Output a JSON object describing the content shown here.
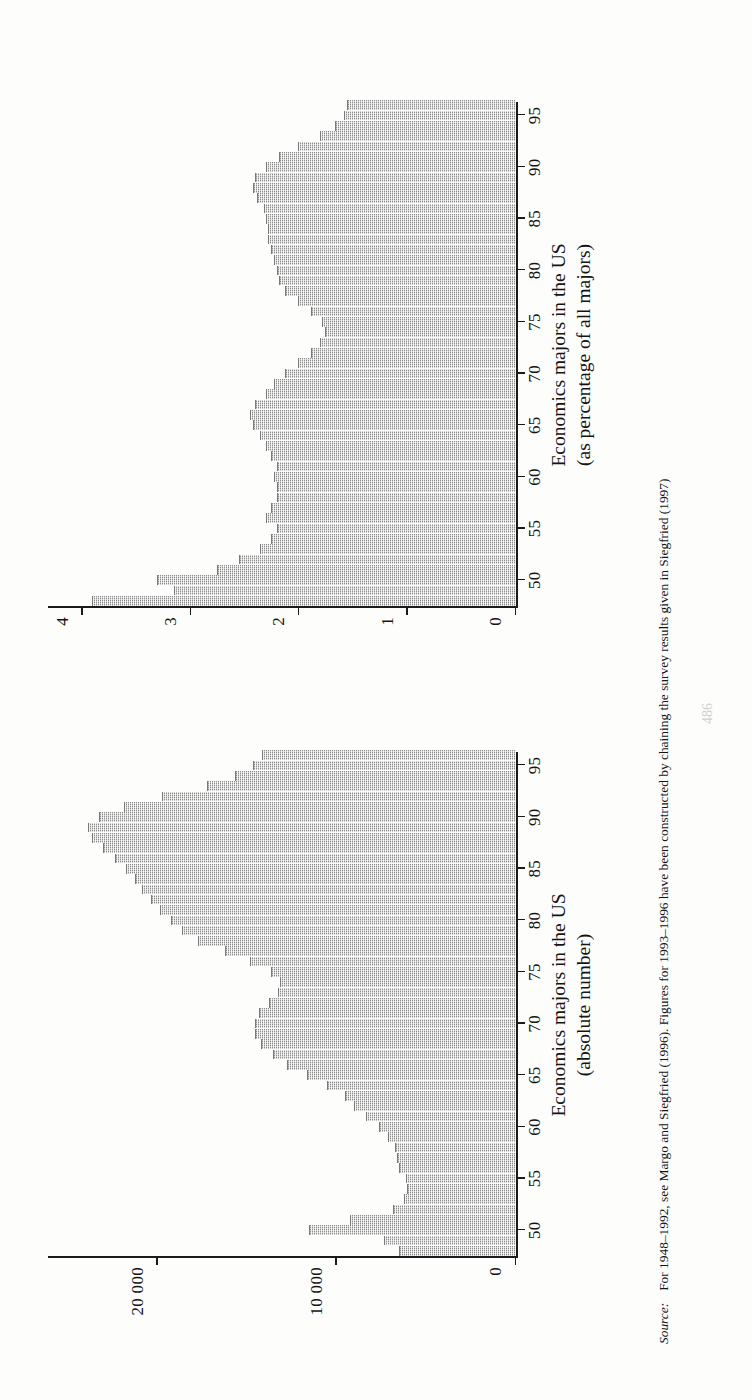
{
  "page": {
    "number": "486"
  },
  "source": {
    "label": "Source:",
    "text": "For 1948–1992, see Margo and Siegfried (1996). Figures for 1993–1996 have been constructed by chaining the survey results given in Siegfried (1997)"
  },
  "charts": [
    {
      "id": "economics-majors-absolute",
      "caption_line1": "Economics majors in the US",
      "caption_line2": "(absolute number)",
      "chart_data": {
        "type": "bar",
        "title": "Economics majors in the US (absolute number)",
        "xlabel": "",
        "ylabel": "",
        "grid": false,
        "legend": null,
        "xlim": [
          1947.5,
          1996.5
        ],
        "ylim": [
          0,
          26000
        ],
        "xticks": [
          50,
          55,
          60,
          65,
          70,
          75,
          80,
          85,
          90,
          95
        ],
        "xticklabels": [
          "50",
          "55",
          "60",
          "65",
          "70",
          "75",
          "80",
          "85",
          "90",
          "95"
        ],
        "yticks": [
          0,
          10000,
          20000
        ],
        "yticklabels": [
          "0",
          "10 000",
          "20 000"
        ],
        "categories": [
          1948,
          1949,
          1950,
          1951,
          1952,
          1953,
          1954,
          1955,
          1956,
          1957,
          1958,
          1959,
          1960,
          1961,
          1962,
          1963,
          1964,
          1965,
          1966,
          1967,
          1968,
          1969,
          1970,
          1971,
          1972,
          1973,
          1974,
          1975,
          1976,
          1977,
          1978,
          1979,
          1980,
          1981,
          1982,
          1983,
          1984,
          1985,
          1986,
          1987,
          1988,
          1989,
          1990,
          1991,
          1992,
          1993,
          1994,
          1995,
          1996
        ],
        "values": [
          6500,
          7300,
          11500,
          9200,
          6800,
          6200,
          6000,
          6100,
          6500,
          6600,
          6700,
          7100,
          7600,
          8300,
          9000,
          9500,
          10500,
          11600,
          12700,
          13500,
          14200,
          14500,
          14500,
          14300,
          13700,
          13200,
          13100,
          13600,
          14800,
          16200,
          17700,
          18600,
          19200,
          19800,
          20300,
          20800,
          21200,
          21700,
          22300,
          23000,
          23600,
          23800,
          23200,
          21800,
          19700,
          17200,
          15600,
          14600,
          14100
        ]
      }
    },
    {
      "id": "economics-majors-percentage",
      "caption_line1": "Economics majors in the US",
      "caption_line2": "(as percentage of all majors)",
      "chart_data": {
        "type": "bar",
        "title": "Economics majors in the US (as percentage of all majors)",
        "xlabel": "",
        "ylabel": "",
        "grid": false,
        "legend": null,
        "xlim": [
          1947.5,
          1996.5
        ],
        "ylim": [
          0,
          4.3
        ],
        "xticks": [
          50,
          55,
          60,
          65,
          70,
          75,
          80,
          85,
          90,
          95
        ],
        "xticklabels": [
          "50",
          "55",
          "60",
          "65",
          "70",
          "75",
          "80",
          "85",
          "90",
          "95"
        ],
        "yticks": [
          0,
          1,
          2,
          3,
          4
        ],
        "yticklabels": [
          "0",
          "1",
          "2",
          "3",
          "4"
        ],
        "categories": [
          1948,
          1949,
          1950,
          1951,
          1952,
          1953,
          1954,
          1955,
          1956,
          1957,
          1958,
          1959,
          1960,
          1961,
          1962,
          1963,
          1964,
          1965,
          1966,
          1967,
          1968,
          1969,
          1970,
          1971,
          1972,
          1973,
          1974,
          1975,
          1976,
          1977,
          1978,
          1979,
          1980,
          1981,
          1982,
          1983,
          1984,
          1985,
          1986,
          1987,
          1988,
          1989,
          1990,
          1991,
          1992,
          1993,
          1994,
          1995,
          1996
        ],
        "values": [
          3.9,
          3.15,
          3.3,
          2.75,
          2.55,
          2.35,
          2.25,
          2.2,
          2.3,
          2.25,
          2.2,
          2.2,
          2.22,
          2.2,
          2.25,
          2.3,
          2.35,
          2.42,
          2.45,
          2.4,
          2.3,
          2.22,
          2.12,
          2.0,
          1.88,
          1.8,
          1.75,
          1.78,
          1.88,
          2.0,
          2.12,
          2.18,
          2.2,
          2.22,
          2.25,
          2.28,
          2.28,
          2.3,
          2.32,
          2.38,
          2.42,
          2.4,
          2.3,
          2.18,
          2.0,
          1.8,
          1.66,
          1.58,
          1.55
        ]
      }
    }
  ]
}
